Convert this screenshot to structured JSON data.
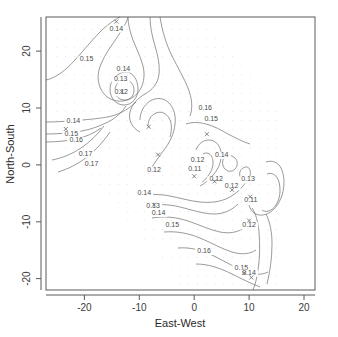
{
  "chart_data": {
    "type": "line",
    "subtype": "contour",
    "title": "",
    "xlabel": "East-West",
    "ylabel": "North-South",
    "xlim": [
      -27,
      22
    ],
    "ylim": [
      -22,
      26
    ],
    "xticks": [
      -20,
      -10,
      0,
      10,
      20
    ],
    "yticks": [
      -20,
      -10,
      0,
      10,
      20
    ],
    "xtick_labels": [
      "-20",
      "-10",
      "0",
      "10",
      "20"
    ],
    "ytick_labels": [
      "-20",
      "-10",
      "0",
      "10",
      "20"
    ],
    "grid": false,
    "legend": "none",
    "contour_levels": [
      0.11,
      0.12,
      0.13,
      0.14,
      0.15,
      0.16,
      0.17
    ],
    "contour_labels": [
      {
        "text": "0.14",
        "x": -14.2,
        "y": 23.6
      },
      {
        "text": "0.15",
        "x": -19.6,
        "y": 18.2
      },
      {
        "text": "0.14",
        "x": -12.9,
        "y": 16.6
      },
      {
        "text": "0.13",
        "x": -13.4,
        "y": 14.7
      },
      {
        "text": "0.12",
        "x": -13.3,
        "y": 12.4
      },
      {
        "text": "0.16",
        "x": 2.0,
        "y": 9.6
      },
      {
        "text": "0.15",
        "x": 3.1,
        "y": 7.8
      },
      {
        "text": "0.14",
        "x": -22.0,
        "y": 7.4
      },
      {
        "text": "0.15",
        "x": -22.4,
        "y": 5.1
      },
      {
        "text": "0.16",
        "x": -21.5,
        "y": 4.0
      },
      {
        "text": "0.17",
        "x": -19.8,
        "y": 1.6
      },
      {
        "text": "0.17",
        "x": -18.7,
        "y": -0.2
      },
      {
        "text": "0.14",
        "x": 5.0,
        "y": 1.4
      },
      {
        "text": "0.12",
        "x": 0.6,
        "y": 0.6
      },
      {
        "text": "0.11",
        "x": 0.1,
        "y": -1.1
      },
      {
        "text": "0.12",
        "x": -7.3,
        "y": -1.2
      },
      {
        "text": "0.12",
        "x": 4.0,
        "y": -2.9
      },
      {
        "text": "0.13",
        "x": 9.8,
        "y": -2.9
      },
      {
        "text": "0.12",
        "x": 6.8,
        "y": -4.1
      },
      {
        "text": "0.14",
        "x": -9.1,
        "y": -5.3
      },
      {
        "text": "0.11",
        "x": 10.3,
        "y": -6.6
      },
      {
        "text": "0.13",
        "x": -7.5,
        "y": -7.6
      },
      {
        "text": "0.14",
        "x": -6.5,
        "y": -8.8
      },
      {
        "text": "0.12",
        "x": 10.0,
        "y": -11.0
      },
      {
        "text": "0.15",
        "x": -4.0,
        "y": -10.9
      },
      {
        "text": "0.16",
        "x": 1.8,
        "y": -15.5
      },
      {
        "text": "0.15",
        "x": 8.6,
        "y": -18.4
      },
      {
        "text": "0.14",
        "x": 10.0,
        "y": -19.3
      }
    ],
    "data_point_markers": [
      {
        "x": -14.2,
        "y": 25.2
      },
      {
        "x": -13.2,
        "y": 12.9
      },
      {
        "x": -23.4,
        "y": 6.3
      },
      {
        "x": -8.3,
        "y": 6.7
      },
      {
        "x": 2.3,
        "y": 5.4
      },
      {
        "x": -6.6,
        "y": 1.8
      },
      {
        "x": 0.0,
        "y": -2.0
      },
      {
        "x": 3.7,
        "y": -2.9
      },
      {
        "x": 6.9,
        "y": -4.4
      },
      {
        "x": 10.2,
        "y": -5.6
      },
      {
        "x": 10.0,
        "y": -9.8
      },
      {
        "x": -7.3,
        "y": -7.0
      },
      {
        "x": 9.1,
        "y": -19.0
      },
      {
        "x": 10.4,
        "y": -19.8
      }
    ]
  },
  "axes": {
    "x_title": "East-West",
    "y_title": "North-South"
  }
}
